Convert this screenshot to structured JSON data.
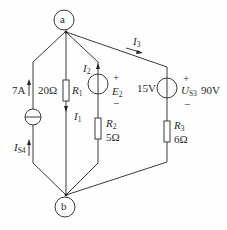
{
  "diagram": {
    "type": "circuit",
    "nodes": [
      {
        "id": "a",
        "label": "a"
      },
      {
        "id": "b",
        "label": "b"
      }
    ],
    "branches": {
      "current_source": {
        "value": "7A",
        "name_main": "I",
        "name_sub": "S4"
      },
      "r1": {
        "value": "20Ω",
        "name_main": "R",
        "name_sub": "1",
        "current_main": "I",
        "current_sub": "1"
      },
      "e2": {
        "name_main": "E",
        "name_sub": "2",
        "plus": "+",
        "minus": "−",
        "current_main": "I",
        "current_sub": "2"
      },
      "r2": {
        "name_main": "R",
        "name_sub": "2",
        "value": "5Ω"
      },
      "us3": {
        "left_value": "15V",
        "name_main": "U",
        "name_sub": "S3",
        "right_value": "90V",
        "plus": "+",
        "minus": "−"
      },
      "r3": {
        "name_main": "R",
        "name_sub": "3",
        "value": "6Ω"
      },
      "i3": {
        "current_main": "I",
        "current_sub": "3"
      }
    },
    "colors": {
      "line": "#3a3a3a",
      "text": "#2a2a2a",
      "background": "#fefefe"
    }
  }
}
